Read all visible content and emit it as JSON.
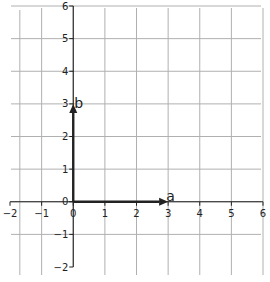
{
  "chart_data": {
    "type": "vector",
    "title": "",
    "xlabel": "",
    "ylabel": "",
    "xlim": [
      -2,
      6
    ],
    "ylim": [
      -2,
      6
    ],
    "grid": true,
    "x_ticks": [
      "−2",
      "−1",
      "0",
      "1",
      "2",
      "3",
      "4",
      "5",
      "6"
    ],
    "y_ticks": [
      "−2",
      "−1",
      "0",
      "1",
      "2",
      "3",
      "4",
      "5",
      "6"
    ],
    "vectors": [
      {
        "name": "a",
        "origin": [
          0,
          0
        ],
        "end": [
          3,
          0
        ],
        "label": "a"
      },
      {
        "name": "b",
        "origin": [
          0,
          0
        ],
        "end": [
          0,
          3
        ],
        "label": "b"
      }
    ],
    "colors": {
      "grid": "#b0b0b0",
      "axis": "#222222",
      "vector": "#222222"
    }
  }
}
